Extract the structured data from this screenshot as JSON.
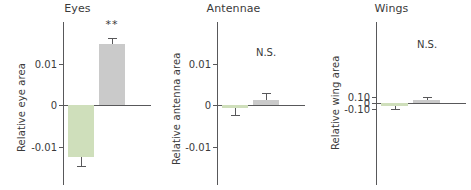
{
  "chart_data": {
    "type": "bar",
    "title": "",
    "layout": {
      "panels": 3,
      "grid": false,
      "legend": "none",
      "orientation": "vertical",
      "shared_x": false
    },
    "series_colors": {
      "control_green": "#cfdfbb",
      "treatment_gray": "#cacaca",
      "axis": "#58585a",
      "text": "#3a3a3a"
    },
    "panels": [
      {
        "id": "eyes",
        "title": "Eyes",
        "ylabel": "Relative eye area",
        "ylim": [
          -0.018,
          0.019
        ],
        "yticks": [
          0.01,
          0,
          -0.01
        ],
        "yticklabels": [
          "0.01",
          "0",
          "-0.01"
        ],
        "annotation": "**",
        "annotation_x_category": "gray",
        "categories": [
          "green",
          "gray"
        ],
        "values": [
          -0.0125,
          0.0148
        ],
        "errors": [
          0.0022,
          0.0013
        ]
      },
      {
        "id": "antennae",
        "title": "Antennae",
        "ylabel": "Relative antenna area",
        "ylim": [
          -0.018,
          0.019
        ],
        "yticks": [
          0.01,
          0,
          -0.01
        ],
        "yticklabels": [
          "0.01",
          "0",
          "-0.01"
        ],
        "annotation": "N.S.",
        "annotation_x_category": "gray",
        "categories": [
          "green",
          "gray"
        ],
        "values": [
          -0.0007,
          0.0013
        ],
        "errors": [
          0.0017,
          0.0015
        ]
      },
      {
        "id": "wings",
        "title": "Wings",
        "ylabel": "Relative wing area",
        "ylim": [
          -0.135,
          0.145
        ],
        "yticks": [
          0.1,
          0,
          -0.1
        ],
        "yticklabels": [
          "0.10",
          "0",
          "-0.10"
        ],
        "annotation": "N.S.",
        "annotation_x_category": "gray",
        "categories": [
          "green",
          "gray"
        ],
        "values": [
          -0.057,
          0.057
        ],
        "errors": [
          0.045,
          0.048
        ]
      }
    ]
  }
}
